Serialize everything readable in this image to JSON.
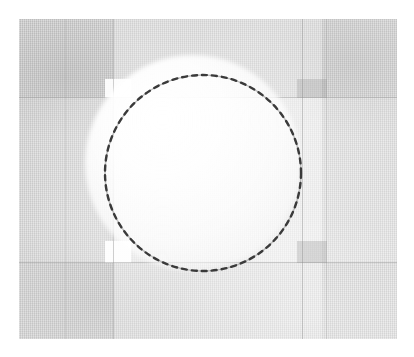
{
  "figure": {
    "title": "",
    "kind": "scanned grayscale photographic plate",
    "plate": {
      "x": 19,
      "y": 19,
      "width": 378,
      "height": 320,
      "background_color": "#c9c9c9",
      "page_color": "#ffffff"
    }
  },
  "chart_data": {
    "type": "scatter",
    "title": "",
    "subtitle": "",
    "xlabel": "",
    "ylabel": "",
    "grid": true,
    "legend_position": "none",
    "tick_labels_x": [],
    "tick_labels_y": [],
    "annotations": [
      {
        "name": "dashed-circle",
        "shape": "circle",
        "center_x": 203,
        "center_y": 173,
        "radius": 98,
        "stroke_color": "#3a3a3a",
        "stroke_width": 2,
        "dash": "dotted-dashed",
        "label": ""
      },
      {
        "name": "interior-glow",
        "shape": "radial-gradient",
        "center_x": 193,
        "center_y": 163,
        "radius": 108,
        "color": "#ffffff",
        "label": ""
      }
    ],
    "gridlines": {
      "horizontal_y": [
        97,
        262
      ],
      "vertical_x": [
        65,
        113,
        302,
        326
      ]
    },
    "regions": [
      {
        "name": "light-column",
        "x": 113,
        "y": 19,
        "width": 209,
        "height": 320,
        "tone": "light"
      },
      {
        "name": "light-row",
        "x": 19,
        "y": 97,
        "width": 378,
        "height": 166,
        "tone": "light"
      },
      {
        "name": "white-patch-top-left",
        "x": 105,
        "y": 79,
        "width": 26,
        "height": 19,
        "tone": "white"
      },
      {
        "name": "white-patch-bottom-left",
        "x": 105,
        "y": 241,
        "width": 26,
        "height": 22,
        "tone": "white"
      },
      {
        "name": "dark-patch-top-right",
        "x": 297,
        "y": 79,
        "width": 30,
        "height": 19,
        "tone": "dark"
      },
      {
        "name": "dark-patch-bottom-right",
        "x": 297,
        "y": 241,
        "width": 30,
        "height": 22,
        "tone": "dark"
      }
    ]
  },
  "colors": {
    "plate_gray": "#c9c9c9",
    "grid_gray": "#8c8c8c",
    "circle_stroke": "#3a3a3a",
    "highlight_white": "#ffffff",
    "page_white": "#ffffff"
  }
}
